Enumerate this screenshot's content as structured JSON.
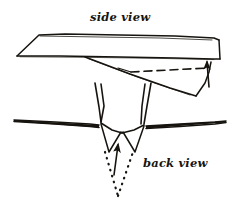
{
  "figure": {
    "kind": "hand-drawn-diagram",
    "background_color": "#ffffff",
    "ink_color": "#17140f",
    "width": 235,
    "height": 211,
    "labels": {
      "side_view": "side view",
      "back_view": "back view"
    },
    "annotations": {
      "side_view_arrow": "arrow-up",
      "back_view_arrow": "arrow-up",
      "side_view_fold_line_style": "dashed",
      "back_view_fold_line_style": "dotted"
    }
  }
}
